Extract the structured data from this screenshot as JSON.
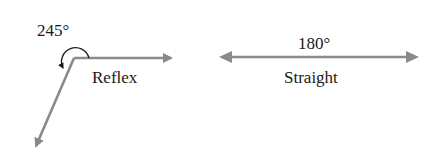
{
  "colors": {
    "ray": "#8a8a8a",
    "text": "#1a1a1a",
    "arc": "#1a1a1a"
  },
  "reflex": {
    "measure": "245°",
    "name": "Reflex"
  },
  "straight": {
    "measure": "180°",
    "name": "Straight"
  }
}
